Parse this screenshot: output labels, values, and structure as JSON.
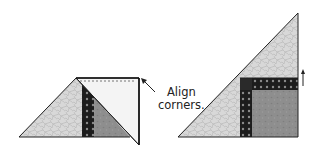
{
  "figure_left": {
    "name": "Half-square triangle with strip and folded square",
    "annotation": {
      "line1": "Align",
      "line2": "corners."
    }
  },
  "figure_right": {
    "name": "Completed corner unit triangle",
    "arrow_direction": "up"
  },
  "colors": {
    "light_print": "#d6d6d6",
    "dark_print": "#1e1e1e",
    "medium_gray": "#8c8c8c",
    "pale_square": "#f2f2f2",
    "outline": "#222222"
  }
}
